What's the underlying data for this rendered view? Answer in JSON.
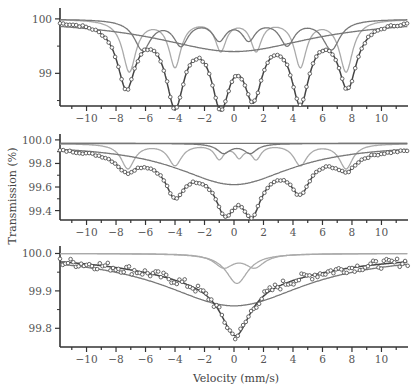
{
  "figure": {
    "ylabel": "Transmission (%)",
    "xlabel": "Velocity (mm/s)",
    "colors": {
      "axis": "#333333",
      "data_points": "#555555",
      "fit_total": "#444444",
      "component_dark": "#777777",
      "component_light": "#aaaaaa"
    }
  },
  "chart_data": [
    {
      "type": "line",
      "panel": "top",
      "title": "",
      "xlabel": "",
      "ylabel": "Transmission (%)",
      "xlim": [
        -11.8,
        11.8
      ],
      "ylim": [
        98.4,
        100.2
      ],
      "x_ticks": [
        -10,
        -8,
        -6,
        -4,
        -2,
        0,
        2,
        4,
        6,
        8,
        10
      ],
      "y_ticks": [
        99,
        100
      ],
      "y_tick_labels": [
        "99",
        "100"
      ],
      "series": [
        {
          "name": "experimental",
          "style": "circles",
          "baseline": 100.0,
          "dips": [
            {
              "x": -7.3,
              "depth": 1.3
            },
            {
              "x": -4.0,
              "depth": 1.55
            },
            {
              "x": -0.9,
              "depth": 1.45
            },
            {
              "x": 1.3,
              "depth": 1.3
            },
            {
              "x": 4.5,
              "depth": 1.5
            },
            {
              "x": 7.7,
              "depth": 1.3
            }
          ]
        },
        {
          "name": "sextet-1 (light)",
          "style": "light",
          "dips": [
            {
              "x": -7.1,
              "depth": 0.95,
              "w": 0.55
            },
            {
              "x": -4.0,
              "depth": 0.85,
              "w": 0.5
            },
            {
              "x": -0.9,
              "depth": 0.55,
              "w": 0.45
            },
            {
              "x": 1.5,
              "depth": 0.55,
              "w": 0.45
            },
            {
              "x": 4.5,
              "depth": 0.85,
              "w": 0.5
            },
            {
              "x": 7.6,
              "depth": 0.95,
              "w": 0.55
            }
          ]
        },
        {
          "name": "sextet-2 (dark)",
          "style": "dark",
          "dips": [
            {
              "x": -6.2,
              "depth": 0.55,
              "w": 0.7
            },
            {
              "x": -3.6,
              "depth": 0.45,
              "w": 0.6
            },
            {
              "x": -1.0,
              "depth": 0.35,
              "w": 0.55
            },
            {
              "x": 1.0,
              "depth": 0.35,
              "w": 0.55
            },
            {
              "x": 3.6,
              "depth": 0.45,
              "w": 0.6
            },
            {
              "x": 6.6,
              "depth": 0.55,
              "w": 0.7
            }
          ]
        },
        {
          "name": "broad distribution",
          "style": "dark",
          "dips": [
            {
              "x": 0.0,
              "depth": 0.6,
              "w": 6.5
            }
          ]
        }
      ]
    },
    {
      "type": "line",
      "panel": "middle",
      "title": "",
      "xlabel": "",
      "ylabel": "Transmission (%)",
      "xlim": [
        -11.8,
        11.8
      ],
      "ylim": [
        99.32,
        100.05
      ],
      "x_ticks": [
        -10,
        -8,
        -6,
        -4,
        -2,
        0,
        2,
        4,
        6,
        8,
        10
      ],
      "y_ticks": [
        99.4,
        99.6,
        99.8,
        100.0
      ],
      "y_tick_labels": [
        "99.4",
        "99.6",
        "99.8",
        "100.0"
      ],
      "series": [
        {
          "name": "experimental",
          "style": "circles",
          "baseline": 99.97,
          "dips": [
            {
              "x": -7.3,
              "depth": 0.38
            },
            {
              "x": -4.0,
              "depth": 0.52
            },
            {
              "x": -0.6,
              "depth": 0.56
            },
            {
              "x": 1.2,
              "depth": 0.58
            },
            {
              "x": 4.5,
              "depth": 0.5
            },
            {
              "x": 7.6,
              "depth": 0.38
            }
          ]
        },
        {
          "name": "sextet (light)",
          "style": "light",
          "dips": [
            {
              "x": -7.2,
              "depth": 0.21,
              "w": 0.55
            },
            {
              "x": -4.0,
              "depth": 0.18,
              "w": 0.55
            },
            {
              "x": -1.0,
              "depth": 0.12,
              "w": 0.4
            },
            {
              "x": 0.35,
              "depth": 0.1,
              "w": 0.35
            },
            {
              "x": 1.5,
              "depth": 0.12,
              "w": 0.4
            },
            {
              "x": 4.5,
              "depth": 0.18,
              "w": 0.55
            },
            {
              "x": 7.6,
              "depth": 0.21,
              "w": 0.55
            }
          ]
        },
        {
          "name": "broad distribution",
          "style": "dark",
          "dips": [
            {
              "x": 0.0,
              "depth": 0.35,
              "w": 4.8
            }
          ]
        },
        {
          "name": "doublet",
          "style": "dark",
          "dips": [
            {
              "x": -0.7,
              "depth": 0.08,
              "w": 0.55
            },
            {
              "x": 1.1,
              "depth": 0.08,
              "w": 0.55
            }
          ]
        },
        {
          "name": "baseline",
          "style": "dark",
          "dips": []
        }
      ]
    },
    {
      "type": "line",
      "panel": "bottom",
      "title": "",
      "xlabel": "Velocity (mm/s)",
      "ylabel": "Transmission (%)",
      "xlim": [
        -11.8,
        11.8
      ],
      "ylim": [
        99.75,
        100.02
      ],
      "x_ticks": [
        -10,
        -8,
        -6,
        -4,
        -2,
        0,
        2,
        4,
        6,
        8,
        10
      ],
      "y_ticks": [
        99.8,
        99.9,
        100.0
      ],
      "y_tick_labels": [
        "99.8",
        "99.9",
        "100.0"
      ],
      "series": [
        {
          "name": "experimental",
          "style": "circles",
          "baseline": 100.0,
          "dips": [
            {
              "x": 0.1,
              "depth": 0.22
            }
          ]
        },
        {
          "name": "broad component",
          "style": "dark",
          "dips": [
            {
              "x": 0.0,
              "depth": 0.14,
              "w": 6.0
            }
          ]
        },
        {
          "name": "narrow singlet",
          "style": "light",
          "dips": [
            {
              "x": 0.2,
              "depth": 0.08,
              "w": 0.9
            }
          ]
        },
        {
          "name": "doublet",
          "style": "light",
          "dips": [
            {
              "x": -0.7,
              "depth": 0.035,
              "w": 0.8
            },
            {
              "x": 1.4,
              "depth": 0.035,
              "w": 0.8
            }
          ]
        }
      ]
    }
  ]
}
